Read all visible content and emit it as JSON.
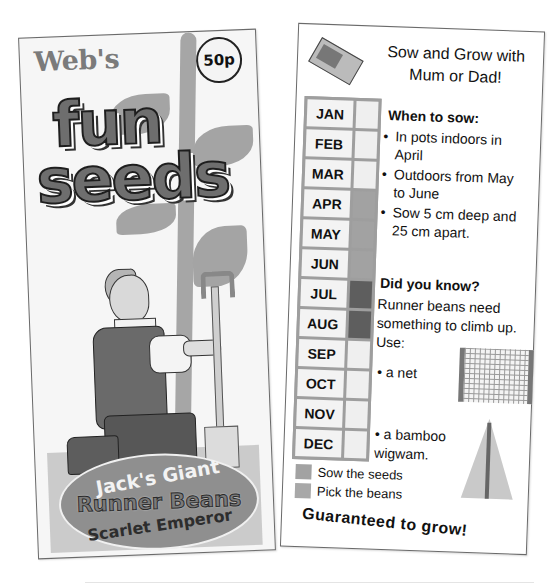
{
  "front": {
    "brand": "Web's",
    "price": "50p",
    "title_line1": "fun",
    "title_line2": "seeds",
    "variety_name": "Jack's Giant",
    "variety_type": "Runner Beans",
    "variety_cultivar": "Scarlet Emperor",
    "illustration": "man-kneeling-with-spade-under-beanstalk"
  },
  "back": {
    "headline": "Sow and Grow with Mum or Dad!",
    "seed_packet_icon": "seed-packet-icon",
    "calendar": {
      "months": [
        {
          "label": "JAN",
          "status": "none"
        },
        {
          "label": "FEB",
          "status": "none"
        },
        {
          "label": "MAR",
          "status": "none"
        },
        {
          "label": "APR",
          "status": "sow"
        },
        {
          "label": "MAY",
          "status": "sow"
        },
        {
          "label": "JUN",
          "status": "sow"
        },
        {
          "label": "JUL",
          "status": "pick"
        },
        {
          "label": "AUG",
          "status": "pick"
        },
        {
          "label": "SEP",
          "status": "none"
        },
        {
          "label": "OCT",
          "status": "none"
        },
        {
          "label": "NOV",
          "status": "none"
        },
        {
          "label": "DEC",
          "status": "none"
        }
      ],
      "colors": {
        "none": "#efefef",
        "sow": "#a2a2a2",
        "pick": "#5e5e5e",
        "grid": "#9e9e9e"
      }
    },
    "when_to_sow": {
      "title": "When to sow:",
      "bullets": [
        "In pots indoors in April",
        "Outdoors from May to June",
        "Sow 5 cm deep and 25 cm apart."
      ]
    },
    "did_you_know": {
      "title": "Did you know?",
      "text": "Runner beans need something to climb up. Use:",
      "options": [
        "a net",
        "a bamboo wigwam."
      ]
    },
    "legend": [
      {
        "label": "Sow the seeds",
        "color": "#a2a2a2"
      },
      {
        "label": "Pick the beans",
        "color": "#a8a8a8"
      }
    ],
    "tagline": "Guaranteed to grow!"
  }
}
